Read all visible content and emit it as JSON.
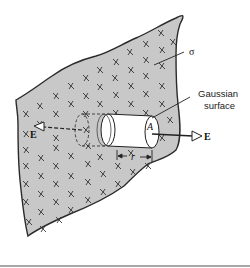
{
  "diagram": {
    "labels": {
      "sigma": "σ",
      "gaussian_line1": "Gaussian",
      "gaussian_line2": "surface",
      "area": "A",
      "field_right": "E",
      "field_left": "E",
      "distance": "r"
    },
    "colors": {
      "sheet_fill": "#c8c8c8",
      "sheet_outline": "#2a2a2a",
      "charge_mark": "#333333",
      "cylinder_fill": "#ffffff",
      "divider": "#8a8a8a"
    },
    "charge_symbol": "+"
  }
}
